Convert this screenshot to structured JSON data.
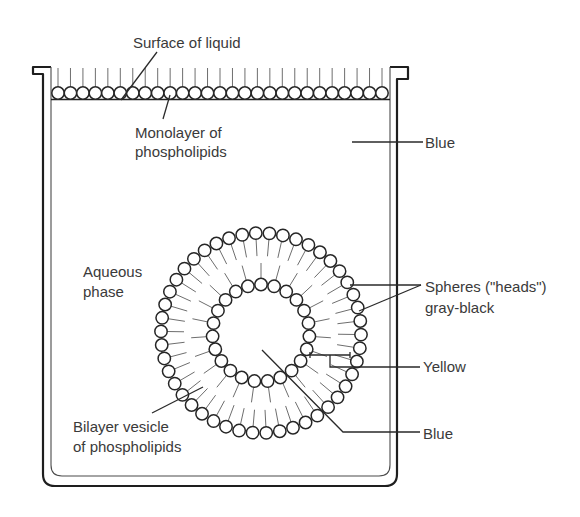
{
  "labels": {
    "surface": "Surface of liquid",
    "monolayer_line1": "Monolayer of",
    "monolayer_line2": "phospholipids",
    "blue_top": "Blue",
    "aqueous_line1": "Aqueous",
    "aqueous_line2": "phase",
    "spheres_line1": "Spheres (\"heads\")",
    "spheres_line2": "gray-black",
    "yellow": "Yellow",
    "blue_bottom": "Blue",
    "bilayer_line1": "Bilayer vesicle",
    "bilayer_line2": "of phospholipids"
  },
  "structure": {
    "monolayer_heads": 27,
    "vesicle_outer_heads": 46,
    "vesicle_inner_heads": 23
  },
  "colors": {
    "line": "#1e1e1e",
    "text": "#3a3a3a",
    "tail": "#6e6e6e",
    "background": "#ffffff"
  }
}
